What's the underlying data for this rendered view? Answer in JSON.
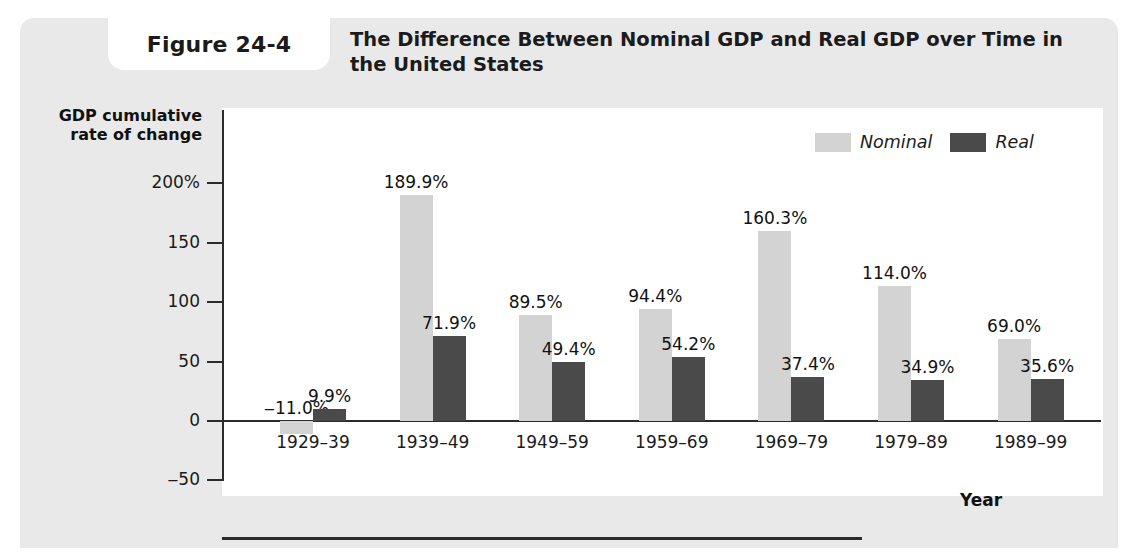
{
  "figure": {
    "number_label": "Figure 24-4",
    "title": "The Difference Between Nominal GDP and Real GDP over Time in the United States"
  },
  "colors": {
    "panel_background": "#e9e9e9",
    "plot_background": "#ffffff",
    "axis": "#2b2b2b",
    "nominal_bar": "#d3d3d3",
    "real_bar": "#4a4a4a",
    "text": "#1b1b1b"
  },
  "legend": {
    "position": "top-right",
    "entries": [
      {
        "label": "Nominal",
        "color": "#d3d3d3"
      },
      {
        "label": "Real",
        "color": "#4a4a4a"
      }
    ]
  },
  "chart_data": {
    "type": "bar",
    "title": "The Difference Between Nominal GDP and Real GDP over Time in the United States",
    "subtitle": "",
    "xlabel": "Year",
    "ylabel": "GDP cumulative rate of change",
    "ylim": [
      -50,
      200
    ],
    "yticks": [
      200,
      150,
      100,
      50,
      0,
      -50
    ],
    "ytick_labels": [
      "200%",
      "150",
      "100",
      "50",
      "0",
      "‒50"
    ],
    "grid": false,
    "legend_position": "top-right",
    "categories": [
      "1929–39",
      "1939–49",
      "1949–59",
      "1959–69",
      "1969–79",
      "1979–89",
      "1989–99"
    ],
    "series": [
      {
        "name": "Nominal",
        "color": "#d3d3d3",
        "values": [
          -11.0,
          189.9,
          89.5,
          94.4,
          160.3,
          114.0,
          69.0
        ],
        "labels": [
          "‒11.0%",
          "189.9%",
          "89.5%",
          "94.4%",
          "160.3%",
          "114.0%",
          "69.0%"
        ]
      },
      {
        "name": "Real",
        "color": "#4a4a4a",
        "values": [
          9.9,
          71.9,
          49.4,
          54.2,
          37.4,
          34.9,
          35.6
        ],
        "labels": [
          "9.9%",
          "71.9%",
          "49.4%",
          "54.2%",
          "37.4%",
          "34.9%",
          "35.6%"
        ]
      }
    ]
  }
}
